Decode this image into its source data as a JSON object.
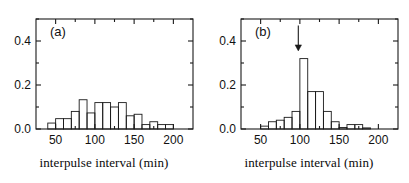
{
  "figure": {
    "width": 409,
    "height": 183,
    "background": "#ffffff",
    "line_color": "#1a1a1a",
    "text_color": "#111111"
  },
  "chart_data": [
    {
      "type": "bar",
      "panel": "a",
      "panel_label": "(a)",
      "title": "",
      "xlabel": "interpulse interval (min)",
      "ylabel": "",
      "xlim": [
        25,
        225
      ],
      "ylim": [
        0.0,
        0.5
      ],
      "xticks": [
        50,
        100,
        150,
        200
      ],
      "xtick_labels": [
        "50",
        "100",
        "150",
        "200"
      ],
      "xminorticks": [
        75,
        125,
        175
      ],
      "yticks": [
        0.0,
        0.2,
        0.4
      ],
      "ytick_labels": [
        "0.0",
        "0.2",
        "0.4"
      ],
      "yminorticks": [
        0.1,
        0.3,
        0.5
      ],
      "grid": false,
      "legend": null,
      "bin_width": 10,
      "bin_starts": [
        40,
        50,
        60,
        70,
        80,
        90,
        100,
        110,
        120,
        130,
        140,
        150,
        160,
        170,
        180,
        190
      ],
      "categories": [
        "40-50",
        "50-60",
        "60-70",
        "70-80",
        "80-90",
        "90-100",
        "100-110",
        "110-120",
        "120-130",
        "130-140",
        "140-150",
        "150-160",
        "160-170",
        "170-180",
        "180-190",
        "190-200"
      ],
      "values": [
        0.027,
        0.047,
        0.047,
        0.08,
        0.133,
        0.073,
        0.12,
        0.12,
        0.1,
        0.12,
        0.06,
        0.067,
        0.02,
        0.033,
        0.02,
        0.02
      ],
      "annotations": []
    },
    {
      "type": "bar",
      "panel": "b",
      "panel_label": "(b)",
      "title": "",
      "xlabel": "interpulse interval (min)",
      "ylabel": "",
      "xlim": [
        25,
        225
      ],
      "ylim": [
        0.0,
        0.5
      ],
      "xticks": [
        50,
        100,
        150,
        200
      ],
      "xtick_labels": [
        "50",
        "100",
        "150",
        "200"
      ],
      "xminorticks": [
        75,
        125,
        175
      ],
      "yticks": [
        0.0,
        0.2,
        0.4
      ],
      "ytick_labels": [
        "0.0",
        "0.2",
        "0.4"
      ],
      "yminorticks": [
        0.1,
        0.3,
        0.5
      ],
      "grid": false,
      "legend": null,
      "bin_width": 10,
      "bin_starts": [
        50,
        60,
        70,
        80,
        90,
        100,
        110,
        120,
        130,
        140,
        150,
        160,
        170,
        180
      ],
      "categories": [
        "50-60",
        "60-70",
        "70-80",
        "80-90",
        "90-100",
        "100-110",
        "110-120",
        "120-130",
        "130-140",
        "140-150",
        "150-160",
        "160-170",
        "170-180",
        "180-190"
      ],
      "values": [
        0.013,
        0.033,
        0.04,
        0.053,
        0.08,
        0.32,
        0.17,
        0.17,
        0.08,
        0.033,
        0.007,
        0.02,
        0.02,
        0.005
      ],
      "annotations": [
        {
          "name": "peak-arrow",
          "type": "arrow-down",
          "x": 98,
          "y_top": 0.47,
          "y_tip": 0.355
        }
      ]
    }
  ]
}
